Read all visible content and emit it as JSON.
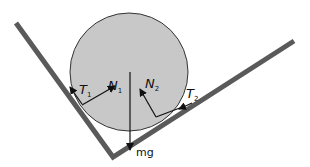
{
  "diagram": {
    "type": "free-body diagram",
    "colors": {
      "sphere_fill": "#c8c8c8",
      "sphere_stroke": "#333333",
      "wall": "#5a5a5a",
      "arrow": "#111111"
    },
    "labels": {
      "t1": {
        "main": "T",
        "sub": "1"
      },
      "n1": {
        "main": "N",
        "sub": "1"
      },
      "n2": {
        "main": "N",
        "sub": "2"
      },
      "t2": {
        "main": "T",
        "sub": "2"
      },
      "weight": "mg"
    }
  }
}
